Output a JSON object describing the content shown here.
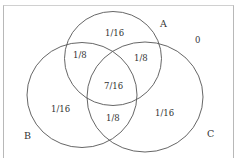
{
  "diagram": {
    "type": "venn-3",
    "sets": [
      {
        "id": "A",
        "label": "A"
      },
      {
        "id": "B",
        "label": "B"
      },
      {
        "id": "C",
        "label": "C"
      }
    ],
    "regions": {
      "A_only": "1/16",
      "B_only": "1/16",
      "C_only": "1/16",
      "AB_only": "1/8",
      "AC_only": "1/8",
      "BC_only": "1/8",
      "ABC": "7/16",
      "outside": "0"
    },
    "colors": {
      "stroke": "#555555",
      "text": "#333333",
      "frame": "#b8b8b8"
    }
  }
}
